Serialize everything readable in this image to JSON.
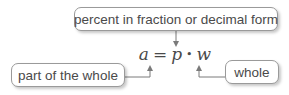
{
  "diagram": {
    "formula": {
      "lhs": "a",
      "equals": "=",
      "p": "p",
      "dot": "•",
      "w": "w"
    },
    "labels": {
      "top": "percent in fraction or decimal form",
      "left": "part of the whole",
      "right": "whole"
    },
    "colors": {
      "text": "#4a4a4a",
      "border": "#9a9a9a",
      "line": "#7a7a7a"
    }
  }
}
